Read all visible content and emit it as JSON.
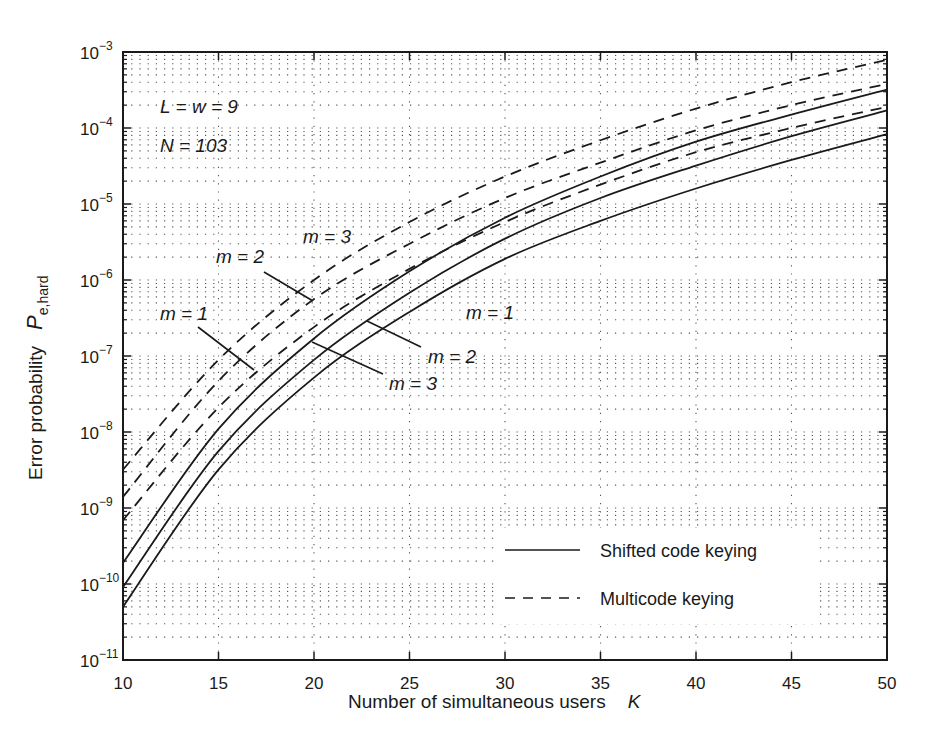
{
  "chart_data": {
    "type": "line",
    "title": "",
    "xlabel": "Number of simultaneous users",
    "xlabel_symbol": "K",
    "ylabel": "Error probability",
    "ylabel_symbol": "P",
    "ylabel_subscript": "e,hard",
    "xlim": [
      10,
      50
    ],
    "ylim": [
      1e-11,
      0.001
    ],
    "yscale": "log",
    "grid": true,
    "x_ticks": [
      10,
      15,
      20,
      25,
      30,
      35,
      40,
      45,
      50
    ],
    "y_ticks": [
      {
        "value": 0.001,
        "base": "10",
        "exp": "−3"
      },
      {
        "value": 0.0001,
        "base": "10",
        "exp": "−4"
      },
      {
        "value": 1e-05,
        "base": "10",
        "exp": "−5"
      },
      {
        "value": 1e-06,
        "base": "10",
        "exp": "−6"
      },
      {
        "value": 1e-07,
        "base": "10",
        "exp": "−7"
      },
      {
        "value": 1e-08,
        "base": "10",
        "exp": "−8"
      },
      {
        "value": 1e-09,
        "base": "10",
        "exp": "−9"
      },
      {
        "value": 1e-10,
        "base": "10",
        "exp": "−10"
      },
      {
        "value": 1e-11,
        "base": "10",
        "exp": "−11"
      }
    ],
    "x": [
      10,
      15,
      20,
      25,
      30,
      35,
      40,
      45,
      50
    ],
    "series": [
      {
        "name": "Shifted code keying, m = 1",
        "style": "solid",
        "values": [
          5e-11,
          3.2e-09,
          5.2e-08,
          3.8e-07,
          1.9e-06,
          6e-06,
          1.6e-05,
          3.8e-05,
          8.3e-05
        ]
      },
      {
        "name": "Shifted code keying, m = 2",
        "style": "solid",
        "values": [
          9.1e-11,
          5.6e-09,
          8.9e-08,
          6.8e-07,
          3.5e-06,
          1.2e-05,
          3.2e-05,
          7.8e-05,
          0.00017
        ]
      },
      {
        "name": "Shifted code keying, m = 3",
        "style": "solid",
        "values": [
          1.9e-10,
          1.1e-08,
          1.7e-07,
          1.3e-06,
          6.6e-06,
          2.3e-05,
          6.6e-05,
          0.00015,
          0.00032
        ]
      },
      {
        "name": "Multicode keying, m = 1",
        "style": "dashed",
        "values": [
          6.9e-10,
          2.1e-08,
          2.4e-07,
          1.4e-06,
          5.8e-06,
          1.8e-05,
          4.8e-05,
          0.0001,
          0.00019
        ]
      },
      {
        "name": "Multicode keying, m = 2",
        "style": "dashed",
        "values": [
          1.4e-09,
          4.7e-08,
          5.6e-07,
          3e-06,
          1.2e-05,
          3.5e-05,
          9.3e-05,
          0.0002,
          0.00038
        ]
      },
      {
        "name": "Multicode keying, m = 3",
        "style": "dashed",
        "values": [
          3.2e-09,
          8.9e-08,
          1e-06,
          5.8e-06,
          2.3e-05,
          6.9e-05,
          0.00018,
          0.0004,
          0.00079
        ]
      }
    ],
    "legend": {
      "position": "lower right",
      "entries": [
        {
          "label": "Shifted code keying",
          "style": "solid"
        },
        {
          "label": "Multicode keying",
          "style": "dashed"
        }
      ]
    },
    "annotations": [
      {
        "text": "L = w = 9",
        "x_px": 160,
        "y_px": 113
      },
      {
        "text": "N = 103",
        "x_px": 160,
        "y_px": 152
      },
      {
        "text": "m = 3",
        "x_px": 303,
        "y_px": 243,
        "target": "Multicode keying, m = 3"
      },
      {
        "text": "m = 2",
        "x_px": 216,
        "y_px": 263,
        "target": "Multicode keying, m = 2",
        "leader": [
          [
            264,
            272
          ],
          [
            313,
            301
          ]
        ]
      },
      {
        "text": "m = 1",
        "x_px": 160,
        "y_px": 320,
        "target": "Multicode keying, m = 1",
        "leader": [
          [
            198,
            327
          ],
          [
            254,
            370
          ]
        ]
      },
      {
        "text": "m = 1",
        "x_px": 466,
        "y_px": 319,
        "target": "Shifted code keying, m = 1"
      },
      {
        "text": "m = 2",
        "x_px": 428,
        "y_px": 363,
        "target": "Shifted code keying, m = 2",
        "leader": [
          [
            367,
            321
          ],
          [
            421,
            347
          ]
        ]
      },
      {
        "text": "m = 3",
        "x_px": 389,
        "y_px": 390,
        "target": "Shifted code keying, m = 3",
        "leader": [
          [
            312,
            342
          ],
          [
            383,
            374
          ]
        ]
      }
    ],
    "colors": {
      "line": "#1a1a1a",
      "grid": "#555555",
      "background": "#ffffff"
    }
  }
}
